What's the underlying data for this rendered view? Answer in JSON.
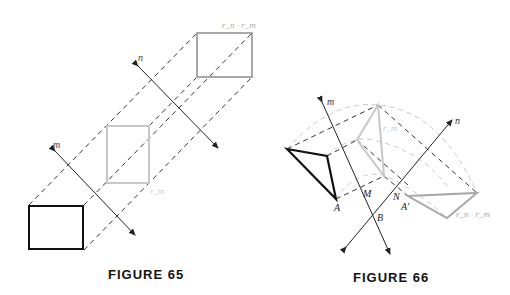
{
  "figures": [
    {
      "caption": "FIGURE 65",
      "labels": {
        "line_m": "m",
        "line_n": "n",
        "image_m": "r_m",
        "image_nm": "r_n · r_m"
      }
    },
    {
      "caption": "FIGURE 66",
      "labels": {
        "line_m": "m",
        "line_n": "n",
        "point_A": "A",
        "point_A_prime": "A′",
        "point_B": "B",
        "point_M": "M",
        "point_N": "N",
        "image_m": "r_m",
        "image_nm": "r_n · r_m"
      }
    }
  ],
  "colors": {
    "original": "#111111",
    "image_m": "#c8c8c8",
    "image_nm": "#a8a8a8",
    "dashed": "#333333",
    "arcs": "#c8c8c8"
  }
}
